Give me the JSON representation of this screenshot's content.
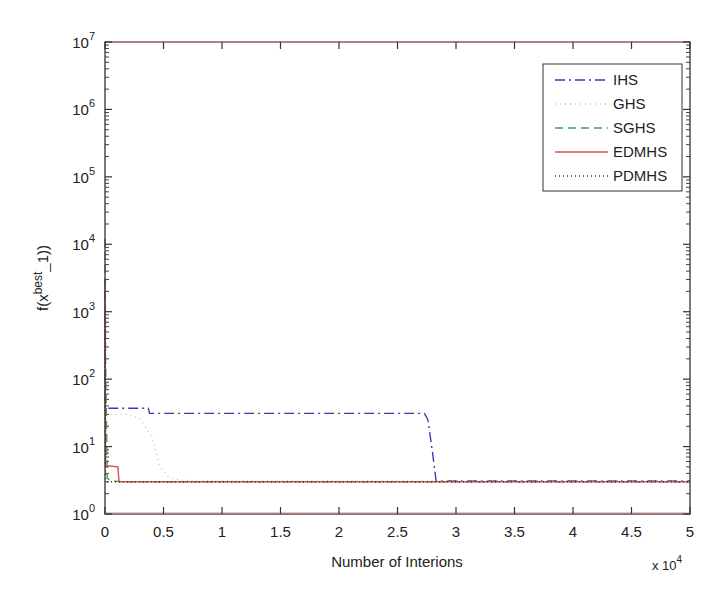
{
  "chart_data": {
    "type": "line",
    "title": "",
    "xlabel": "Number of Interions",
    "x_multiplier": "x 10^4",
    "ylabel": "f(x^best_1))",
    "xscale": "linear",
    "yscale": "log",
    "xlim": [
      0,
      5
    ],
    "ylim": [
      1,
      10000000
    ],
    "grid": false,
    "legend_position": "upper right",
    "x_ticks": [
      "0",
      "0.5",
      "1",
      "1.5",
      "2",
      "2.5",
      "3",
      "3.5",
      "4",
      "4.5",
      "5"
    ],
    "y_ticks": [
      {
        "base": "10",
        "exp": "0",
        "value": 1
      },
      {
        "base": "10",
        "exp": "1",
        "value": 10
      },
      {
        "base": "10",
        "exp": "2",
        "value": 100
      },
      {
        "base": "10",
        "exp": "3",
        "value": 1000
      },
      {
        "base": "10",
        "exp": "4",
        "value": 10000
      },
      {
        "base": "10",
        "exp": "5",
        "value": 100000
      },
      {
        "base": "10",
        "exp": "6",
        "value": 1000000
      },
      {
        "base": "10",
        "exp": "7",
        "value": 10000000
      }
    ],
    "series": [
      {
        "name": "IHS",
        "color": "#3a3ab8",
        "dash": "10,4,2,4",
        "x": [
          0,
          0.001,
          0.03,
          0.37,
          0.38,
          2.73,
          2.76,
          2.8,
          2.83,
          5
        ],
        "y": [
          2000,
          37,
          37,
          37,
          31,
          31,
          25,
          8,
          3.1,
          3.1
        ]
      },
      {
        "name": "GHS",
        "color": "#c0c0c0",
        "dash": "1,4",
        "x": [
          0,
          0.001,
          0.2,
          0.3,
          0.4,
          0.47,
          0.54,
          0.63,
          0.75,
          5
        ],
        "y": [
          1500,
          30,
          30,
          26,
          14,
          5,
          3.6,
          3.2,
          3.1,
          3.1
        ]
      },
      {
        "name": "SGHS",
        "color": "#3fa35a",
        "dash": "8,5",
        "x": [
          0,
          0.005,
          0.02,
          0.05,
          0.15,
          5
        ],
        "y": [
          12000,
          200,
          3.4,
          3.1,
          3.0,
          3.0
        ]
      },
      {
        "name": "EDMHS",
        "color": "#d9534f",
        "dash": "",
        "x": [
          0,
          0.005,
          0.01,
          0.11,
          0.12,
          5
        ],
        "y": [
          3000,
          5.2,
          5.2,
          5.0,
          3.0,
          3.0
        ]
      },
      {
        "name": "PDMHS",
        "color": "#333333",
        "dash": "1,3",
        "x": [
          0,
          0.004,
          0.02,
          0.1,
          5
        ],
        "y": [
          800,
          3.2,
          3.0,
          3.0,
          3.0
        ]
      }
    ]
  },
  "legend": {
    "items": [
      "IHS",
      "GHS",
      "SGHS",
      "EDMHS",
      "PDMHS"
    ]
  },
  "axes": {
    "xlabel": "Number of Interions",
    "x_multiplier_base": "x 10",
    "x_multiplier_exp": "4",
    "ylabel_prefix": "f(x",
    "ylabel_sup": "best",
    "ylabel_suffix": "_1))"
  }
}
